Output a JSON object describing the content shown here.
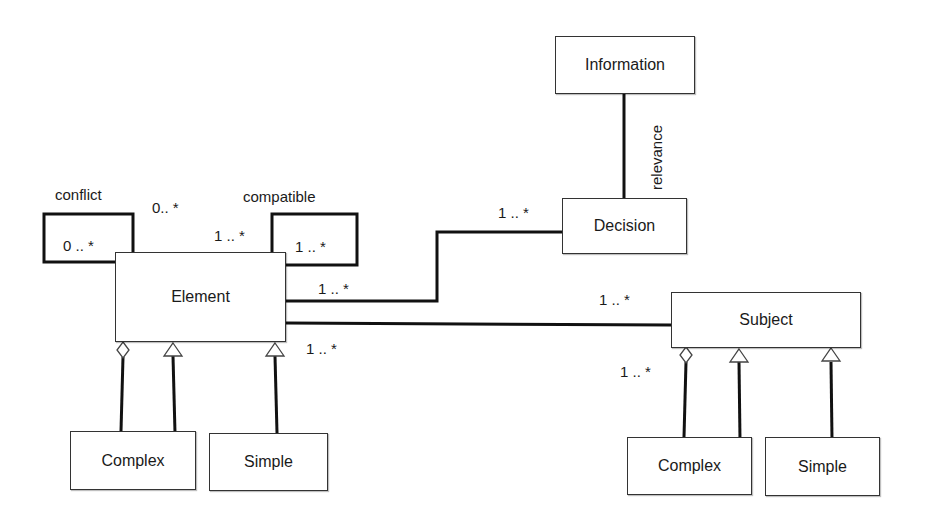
{
  "classes": {
    "information": "Information",
    "decision": "Decision",
    "element": "Element",
    "subject": "Subject",
    "element_complex": "Complex",
    "element_simple": "Simple",
    "subject_complex": "Complex",
    "subject_simple": "Simple"
  },
  "associations": {
    "conflict": {
      "name": "conflict",
      "mult_loop": "0 .. *",
      "mult_top": "0.. *"
    },
    "compatible": {
      "name": "compatible",
      "mult_top": "1 .. *",
      "mult_loop": "1 .. *"
    },
    "relevance": {
      "name": "relevance"
    },
    "element_decision": {
      "mult_element": "1 .. *",
      "mult_decision": "1 .. *"
    },
    "element_subject": {
      "mult_element": "1 .. *",
      "mult_subject": "1 .. *"
    },
    "subject_composition": {
      "mult": "1 .. *"
    }
  },
  "colors": {
    "line": "#111111",
    "box_border": "#333333",
    "background": "#ffffff"
  }
}
